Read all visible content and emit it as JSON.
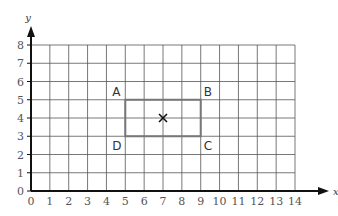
{
  "axes": {
    "x_label": "x",
    "y_label": "y",
    "x_ticks": [
      "0",
      "1",
      "2",
      "3",
      "4",
      "5",
      "6",
      "7",
      "8",
      "9",
      "10",
      "11",
      "12",
      "13",
      "14"
    ],
    "y_ticks": [
      "0",
      "1",
      "2",
      "3",
      "4",
      "5",
      "6",
      "7",
      "8"
    ]
  },
  "rectangle": {
    "corners": [
      {
        "label": "A",
        "x": 5,
        "y": 5
      },
      {
        "label": "B",
        "x": 9,
        "y": 5
      },
      {
        "label": "C",
        "x": 9,
        "y": 3
      },
      {
        "label": "D",
        "x": 5,
        "y": 3
      }
    ],
    "center_marker": {
      "symbol": "×",
      "x": 7,
      "y": 4
    }
  },
  "colors": {
    "grid": "#555555",
    "axis": "#111111",
    "rectangle": "#777777"
  }
}
